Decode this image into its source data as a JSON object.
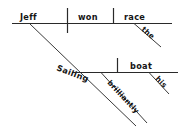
{
  "diagram": {
    "type": "reed-kellogg-sentence-diagram",
    "sentence": "Sailing brilliantly, Jeff won the race his boat.",
    "ink_color": "#2a2a2a",
    "text_color": "#151515",
    "background_color": "#ffffff",
    "main_clause": {
      "subject": "Jeff",
      "verb": "won",
      "direct_object": "race",
      "article_modifier": "the"
    },
    "participial_phrase": {
      "gerund": "Sailing",
      "adverb": "brilliantly",
      "object": "boat",
      "possessive_modifier": "his"
    },
    "labels": {
      "subject": "Jeff",
      "verb": "won",
      "object": "race",
      "article": "the",
      "gerund": "Sailing",
      "adverb": "brilliantly",
      "gerund_object": "boat",
      "possessive": "his"
    }
  }
}
